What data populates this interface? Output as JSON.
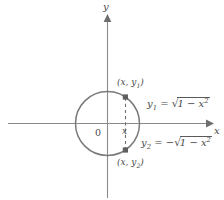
{
  "figure": {
    "background_color": "#ffffff",
    "stroke_color": "#6e6e6e",
    "text_color": "#4a4a4a"
  },
  "axes": {
    "x_label": "x",
    "y_label": "y",
    "origin_label": "0"
  },
  "circle": {
    "center_x": 107.5,
    "center_y": 123.5,
    "radius": 32,
    "equation_implicit": "x^2 + y^2 = 1"
  },
  "chord": {
    "x_tick_label": "x",
    "style": "dashed",
    "x_position": 125.5,
    "top_y": 97,
    "bottom_y": 150
  },
  "points": [
    {
      "name": "upper-point",
      "label_prefix": "(x, y",
      "label_sub": "1",
      "label_suffix": ")",
      "marker_x": 125.5,
      "marker_y": 97
    },
    {
      "name": "lower-point",
      "label_prefix": "(x, y",
      "label_sub": "2",
      "label_suffix": ")",
      "marker_x": 125.5,
      "marker_y": 150
    }
  ],
  "equations": [
    {
      "name": "upper-semicircle-equation",
      "lhs": "y",
      "lhs_sub": "1",
      "relation": "=",
      "sign": "",
      "radical_symbol": "√",
      "radicand": "1 − x",
      "radicand_exponent": "2",
      "plain": "y1 = √(1 − x²)"
    },
    {
      "name": "lower-semicircle-equation",
      "lhs": "y",
      "lhs_sub": "2",
      "relation": "=",
      "sign": "−",
      "radical_symbol": "√",
      "radicand": "1 − x",
      "radicand_exponent": "2",
      "plain": "y2 = −√(1 − x²)"
    }
  ]
}
